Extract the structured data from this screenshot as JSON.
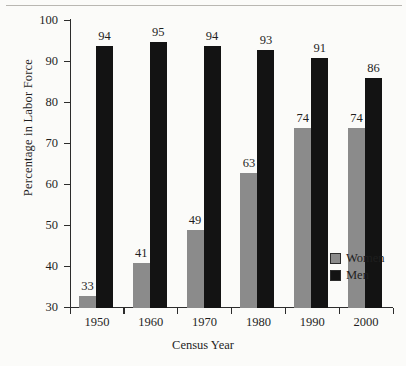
{
  "chart_data": {
    "type": "bar",
    "title": "",
    "xlabel": "Census Year",
    "ylabel": "Percentage in Labor Force",
    "categories": [
      "1950",
      "1960",
      "1970",
      "1980",
      "1990",
      "2000"
    ],
    "series": [
      {
        "name": "Women",
        "color": "#8b8b8b",
        "values": [
          33,
          41,
          49,
          63,
          74,
          74
        ]
      },
      {
        "name": "Men",
        "color": "#131313",
        "values": [
          94,
          95,
          94,
          93,
          91,
          86
        ]
      }
    ],
    "ylim": [
      30,
      100
    ],
    "ytick_labels": [
      "100",
      "90",
      "80",
      "70",
      "60",
      "50",
      "40",
      "30"
    ],
    "ytick_values": [
      100,
      90,
      80,
      70,
      60,
      50,
      40,
      30
    ],
    "grid": false,
    "legend_position": "inside-right",
    "data_labels": true
  },
  "legend": {
    "entries": [
      {
        "label": "Women"
      },
      {
        "label": "Men"
      }
    ]
  }
}
